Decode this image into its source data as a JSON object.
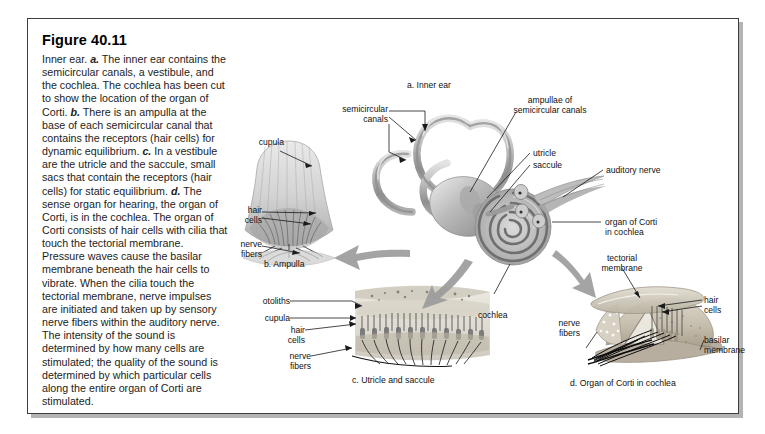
{
  "figure": {
    "number": "Figure 40.11",
    "caption_lead": "Inner ear.",
    "caption_text_line1": "Inner ear. a. The inner ear contains the semicircular canals, a vestibule, and the cochlea. The cochlea has been cut to show the location of the organ of Corti. b. There is an ampulla at the base of each semicircular canal that contains the receptors (hair cells) for dynamic equilibrium. c. In a vestibule are the utricle and the saccule, small sacs that contain the receptors (hair cells) for static equilibrium. d. The sense organ for hearing, the organ of Corti, is in the cochlea. The organ of Corti consists of hair cells with cilia that touch the tectorial membrane. Pressure waves cause the basilar membrane beneath the hair cells to vibrate. When the cilia touch the tectorial membrane, nerve impulses are initiated and taken up by sensory nerve fibers within the auditory nerve. The intensity of the sound is determined by how many cells are stimulated; the quality of the sound is determined by which particular cells along the entire organ of Corti are stimulated.",
    "caption_segments": [
      {
        "text": "Inner ear. ",
        "style": "normal"
      },
      {
        "text": "a.",
        "style": "bold-italic"
      },
      {
        "text": " The inner ear contains the semicircular canals, a vestibule, and the cochlea. The cochlea has been cut to show the location of the organ of Corti. ",
        "style": "normal"
      },
      {
        "text": "b.",
        "style": "bold-italic"
      },
      {
        "text": " There is an ampulla at the base of each semicircular canal that contains the receptors (hair cells) for dynamic equilibrium. ",
        "style": "normal"
      },
      {
        "text": "c.",
        "style": "bold-italic"
      },
      {
        "text": " In a vestibule are the utricle and the saccule, small sacs that contain the receptors (hair cells) for static equilibrium. ",
        "style": "normal"
      },
      {
        "text": "d.",
        "style": "bold-italic"
      },
      {
        "text": " The sense organ for hearing, the organ of Corti, is in the cochlea. The organ of Corti consists of hair cells with cilia that touch the tectorial membrane. Pressure waves cause the basilar membrane beneath the hair cells to vibrate. When the cilia touch the tectorial membrane, nerve impulses are initiated and taken up by sensory nerve fibers within the auditory nerve. The intensity of the sound is determined by how many cells are stimulated; the quality of the sound is determined by which particular cells along the entire organ of Corti are stimulated.",
        "style": "normal"
      }
    ]
  },
  "panels": {
    "a": {
      "title": "a. Inner ear",
      "labels": {
        "semicircular_canals": "semicircular\ncanals",
        "ampullae": "ampullae of\nsemicircular canals",
        "utricle": "utricle",
        "saccule": "saccule",
        "auditory_nerve": "auditory nerve",
        "organ_of_corti": "organ of Corti\nin cochlea",
        "cochlea": "cochlea"
      }
    },
    "b": {
      "title": "b. Ampulla",
      "labels": {
        "cupula": "cupula",
        "hair_cells": "hair\ncells",
        "nerve_fibers": "nerve\nfibers"
      }
    },
    "c": {
      "title": "c. Utricle and saccule",
      "labels": {
        "otoliths": "otoliths",
        "cupula": "cupula",
        "hair_cells": "hair\ncells",
        "nerve_fibers": "nerve\nfibers"
      }
    },
    "d": {
      "title": "d. Organ of Corti in cochlea",
      "labels": {
        "tectorial_membrane": "tectorial\nmembrane",
        "hair_cells": "hair\ncells",
        "basilar_membrane": "basilar\nmembrane",
        "nerve_fibers": "nerve\nfibers"
      }
    }
  },
  "colors": {
    "page_background": "#ffffff",
    "frame_border": "#3d3d3d",
    "frame_shadow": "#b4b4b4",
    "label_text": "#111111",
    "art_gray_dark": "#8d8d8d",
    "art_gray_mid": "#b0b0b0",
    "art_gray_light": "#d6d6d6",
    "art_tan": "#c9c2b4",
    "arrow_gray": "#9a9a9a"
  }
}
